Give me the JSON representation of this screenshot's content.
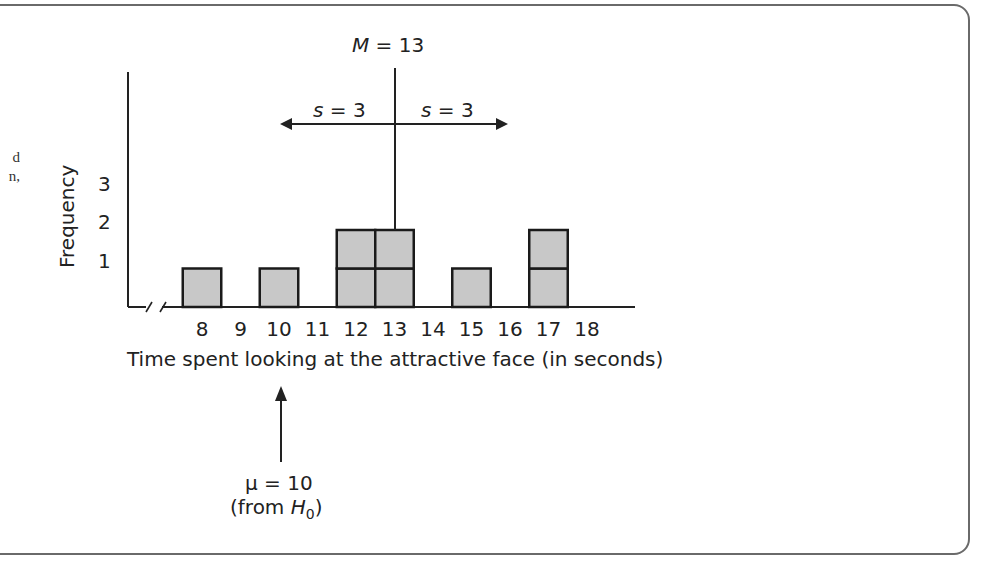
{
  "side_text_fragments": [
    "d",
    "n,"
  ],
  "chart_data": {
    "type": "bar",
    "title": "",
    "xlabel": "Time spent looking at the attractive face (in seconds)",
    "ylabel": "Frequency",
    "categories": [
      "8",
      "9",
      "10",
      "11",
      "12",
      "13",
      "14",
      "15",
      "16",
      "17",
      "18"
    ],
    "values": [
      1,
      0,
      1,
      0,
      2,
      2,
      0,
      1,
      0,
      2,
      0
    ],
    "yticks": [
      "1",
      "2",
      "3"
    ],
    "ylim": [
      0,
      3
    ],
    "axis_break": true,
    "annotations": {
      "mean_label": "M = 13",
      "mean_value": 13,
      "sd_left_label": "s = 3",
      "sd_right_label": "s = 3",
      "mu_label": "μ = 10",
      "mu_value": 10,
      "mu_source": "(from H0)"
    }
  },
  "labels": {
    "mean_M": "M",
    "mean_eq": " = 13",
    "s_left_var": "s",
    "s_left_eq": " = 3",
    "s_right_var": "s",
    "s_right_eq": " = 3",
    "mu_line": "μ = 10",
    "from_open": "(from ",
    "from_H": "H",
    "from_sub": "0",
    "from_close": ")"
  },
  "colors": {
    "bar_fill": "#c8c8c8",
    "bar_stroke": "#1a1a1a",
    "frame": "#6a6a6a"
  }
}
